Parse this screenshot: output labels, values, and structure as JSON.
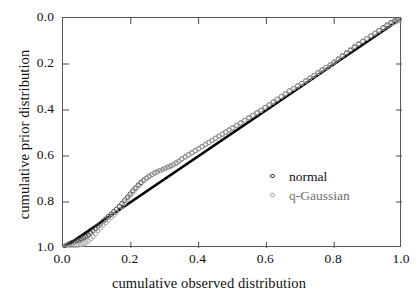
{
  "chart_data": {
    "type": "scatter",
    "title": "",
    "xlabel": "cumulative observed distribution",
    "ylabel": "cumulative prior distribution",
    "xlim": [
      0.0,
      1.0
    ],
    "ylim": [
      0.0,
      1.0
    ],
    "grid": false,
    "legend_position": "inside-lower-right",
    "xticks": [
      "0.0",
      "0.2",
      "0.4",
      "0.6",
      "0.8",
      "1.0"
    ],
    "yticks": [
      "0.0",
      "0.2",
      "0.4",
      "0.6",
      "0.8",
      "1.0"
    ],
    "xtick_values": [
      0.0,
      0.2,
      0.4,
      0.6,
      0.8,
      1.0
    ],
    "ytick_values": [
      0.0,
      0.2,
      0.4,
      0.6,
      0.8,
      1.0
    ],
    "reference_line": {
      "name": "identity",
      "from": [
        0.0,
        0.0
      ],
      "to": [
        1.0,
        1.0
      ],
      "color": "#000000",
      "width": 2.6
    },
    "series": [
      {
        "name": "normal",
        "marker": "open-circle",
        "color": "#3d3d3d",
        "x": [
          0.005,
          0.012,
          0.019,
          0.026,
          0.033,
          0.04,
          0.047,
          0.054,
          0.061,
          0.068,
          0.075,
          0.082,
          0.089,
          0.096,
          0.103,
          0.11,
          0.118,
          0.126,
          0.134,
          0.142,
          0.15,
          0.158,
          0.166,
          0.174,
          0.182,
          0.19,
          0.198,
          0.206,
          0.214,
          0.222,
          0.23,
          0.238,
          0.246,
          0.254,
          0.262,
          0.27,
          0.278,
          0.286,
          0.294,
          0.302,
          0.31,
          0.318,
          0.326,
          0.334,
          0.342,
          0.35,
          0.36,
          0.37,
          0.38,
          0.39,
          0.4,
          0.41,
          0.42,
          0.43,
          0.44,
          0.45,
          0.46,
          0.47,
          0.48,
          0.49,
          0.5,
          0.512,
          0.524,
          0.536,
          0.548,
          0.56,
          0.572,
          0.584,
          0.596,
          0.608,
          0.62,
          0.632,
          0.644,
          0.656,
          0.668,
          0.68,
          0.692,
          0.704,
          0.716,
          0.728,
          0.74,
          0.752,
          0.764,
          0.776,
          0.788,
          0.8,
          0.812,
          0.824,
          0.836,
          0.848,
          0.86,
          0.872,
          0.884,
          0.896,
          0.908,
          0.92,
          0.932,
          0.944,
          0.956,
          0.968,
          0.978,
          0.986,
          0.993,
          0.998
        ],
        "y": [
          0.004,
          0.009,
          0.014,
          0.019,
          0.023,
          0.027,
          0.031,
          0.035,
          0.04,
          0.046,
          0.053,
          0.061,
          0.07,
          0.08,
          0.091,
          0.101,
          0.112,
          0.122,
          0.133,
          0.143,
          0.154,
          0.165,
          0.177,
          0.19,
          0.203,
          0.217,
          0.231,
          0.245,
          0.258,
          0.27,
          0.281,
          0.291,
          0.3,
          0.308,
          0.315,
          0.322,
          0.328,
          0.333,
          0.338,
          0.343,
          0.348,
          0.353,
          0.359,
          0.366,
          0.374,
          0.383,
          0.392,
          0.401,
          0.41,
          0.419,
          0.428,
          0.437,
          0.446,
          0.455,
          0.464,
          0.473,
          0.482,
          0.491,
          0.5,
          0.509,
          0.518,
          0.529,
          0.54,
          0.551,
          0.562,
          0.573,
          0.584,
          0.595,
          0.607,
          0.619,
          0.631,
          0.643,
          0.655,
          0.667,
          0.679,
          0.69,
          0.701,
          0.712,
          0.723,
          0.734,
          0.746,
          0.758,
          0.77,
          0.781,
          0.792,
          0.804,
          0.817,
          0.83,
          0.843,
          0.856,
          0.869,
          0.882,
          0.894,
          0.906,
          0.918,
          0.93,
          0.942,
          0.954,
          0.966,
          0.976,
          0.983,
          0.989,
          0.994,
          0.998
        ]
      },
      {
        "name": "q-Gaussian",
        "marker": "open-circle",
        "color": "#a8a8a8",
        "x": [
          0.005,
          0.012,
          0.019,
          0.026,
          0.033,
          0.04,
          0.047,
          0.054,
          0.061,
          0.068,
          0.075,
          0.082,
          0.089,
          0.096,
          0.103,
          0.11,
          0.118,
          0.126,
          0.134,
          0.142,
          0.15,
          0.158,
          0.166,
          0.174,
          0.182,
          0.19,
          0.198,
          0.206,
          0.214,
          0.222,
          0.23,
          0.238,
          0.246,
          0.254,
          0.262,
          0.27,
          0.278,
          0.286,
          0.294,
          0.302,
          0.31,
          0.318,
          0.326,
          0.334,
          0.342,
          0.35,
          0.36,
          0.37,
          0.38,
          0.39,
          0.4,
          0.41,
          0.42,
          0.43,
          0.44,
          0.45,
          0.46,
          0.47,
          0.48,
          0.49,
          0.5,
          0.512,
          0.524,
          0.536,
          0.548,
          0.56,
          0.572,
          0.584,
          0.596,
          0.608,
          0.62,
          0.632,
          0.644,
          0.656,
          0.668,
          0.68,
          0.692,
          0.704,
          0.716,
          0.728,
          0.74,
          0.752,
          0.764,
          0.776,
          0.788,
          0.8,
          0.812,
          0.824,
          0.836,
          0.848,
          0.86,
          0.872,
          0.884,
          0.896,
          0.908,
          0.92,
          0.932,
          0.944,
          0.956,
          0.968,
          0.978,
          0.986,
          0.993,
          0.998
        ],
        "y": [
          0.002,
          0.005,
          0.008,
          0.011,
          0.013,
          0.015,
          0.017,
          0.019,
          0.022,
          0.027,
          0.034,
          0.043,
          0.054,
          0.066,
          0.079,
          0.091,
          0.103,
          0.114,
          0.125,
          0.136,
          0.147,
          0.159,
          0.172,
          0.186,
          0.2,
          0.215,
          0.23,
          0.245,
          0.259,
          0.272,
          0.284,
          0.295,
          0.305,
          0.314,
          0.322,
          0.329,
          0.335,
          0.34,
          0.345,
          0.35,
          0.355,
          0.36,
          0.366,
          0.373,
          0.381,
          0.39,
          0.399,
          0.408,
          0.417,
          0.426,
          0.435,
          0.444,
          0.453,
          0.462,
          0.471,
          0.48,
          0.489,
          0.498,
          0.507,
          0.516,
          0.525,
          0.536,
          0.547,
          0.558,
          0.569,
          0.58,
          0.591,
          0.602,
          0.614,
          0.626,
          0.638,
          0.65,
          0.662,
          0.674,
          0.686,
          0.697,
          0.708,
          0.719,
          0.73,
          0.742,
          0.754,
          0.766,
          0.778,
          0.789,
          0.8,
          0.813,
          0.827,
          0.841,
          0.855,
          0.868,
          0.881,
          0.893,
          0.904,
          0.915,
          0.926,
          0.937,
          0.948,
          0.959,
          0.969,
          0.978,
          0.985,
          0.99,
          0.995,
          0.999
        ]
      }
    ]
  },
  "axes": {
    "xlabel": "cumulative observed distribution",
    "ylabel": "cumulative prior distribution",
    "xticks": [
      "0.0",
      "0.2",
      "0.4",
      "0.6",
      "0.8",
      "1.0"
    ],
    "yticks": [
      "1.0",
      "0.8",
      "0.6",
      "0.4",
      "0.2",
      "0.0"
    ]
  },
  "legend": {
    "items": [
      {
        "label": "normal",
        "marker": "open-circle",
        "color": "#3d3d3d"
      },
      {
        "label": "q-Gaussian",
        "marker": "open-circle",
        "color": "#a8a8a8"
      }
    ]
  },
  "caption_fragment": ""
}
